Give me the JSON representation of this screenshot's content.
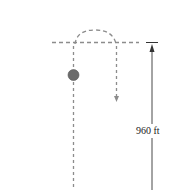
{
  "diagram": {
    "height_label": "960 ft",
    "colors": {
      "dashed_path": "#8c8c8c",
      "ball": "#6b6b6b",
      "ball_outline": "#555555",
      "measure_line": "#333333",
      "text": "#222222"
    },
    "elements": {
      "ball": "projectile",
      "up_path": "dashed vertical path upward",
      "arc": "dashed arc at top of trajectory",
      "down_path": "dashed vertical path downward with arrow",
      "reference_line": "dashed horizontal line at launch-height reference",
      "dimension": "vertical arrow measuring height"
    }
  }
}
